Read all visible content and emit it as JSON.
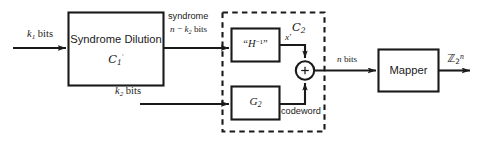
{
  "figure": {
    "type": "block-diagram",
    "colors": {
      "stroke": "#1a1a1a",
      "background": "#ffffff",
      "text": "#1a1a1a"
    }
  },
  "inputs": {
    "k1_bits": "k",
    "k1_sub": "1",
    "k1_suffix": " bits",
    "k2_bits": "k",
    "k2_sub": "2",
    "k2_suffix": " bits"
  },
  "blocks": {
    "syndrome_dilution": {
      "title": "Syndrome Dilution",
      "code_label": "C",
      "code_sub": "1",
      "code_prime": "′"
    },
    "h_inverse": {
      "label": "“H⁻¹”",
      "label_text": "H",
      "label_exp": "−1"
    },
    "g2": {
      "label": "G",
      "label_sub": "2"
    },
    "mapper": {
      "label": "Mapper"
    },
    "adder": {
      "label": "+"
    }
  },
  "group_box": {
    "label": "C",
    "label_sub": "2",
    "style": "dashed"
  },
  "edge_labels": {
    "syndrome_line1": "syndrome",
    "syndrome_line2_n": "n",
    "syndrome_line2_minus": " − ",
    "syndrome_line2_k": "k",
    "syndrome_line2_sub": "2",
    "syndrome_line2_suffix": " bits",
    "x_prime": "x′",
    "codeword": "codeword",
    "n_bits_n": "n",
    "n_bits_suffix": " bits"
  },
  "output": {
    "label": "ℤ",
    "sub": "2",
    "sup": "n"
  }
}
